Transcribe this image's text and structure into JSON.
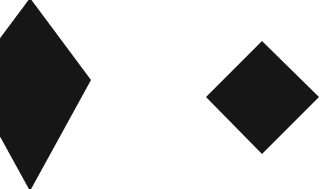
{
  "canvas": {
    "width": 332,
    "height": 189,
    "background": "#ffffff"
  },
  "shapes": [
    {
      "type": "diamond",
      "label": "tall diamond (partially cropped at left edge)",
      "fill": "#161616",
      "points": "30,-2 91,80 30,191 -31,80"
    },
    {
      "type": "diamond",
      "label": "square diamond",
      "fill": "#161616",
      "points": "262,41 319,97 262,154 206,97"
    }
  ]
}
